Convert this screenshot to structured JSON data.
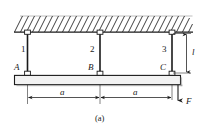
{
  "figure": {
    "caption": "(a)",
    "colors": {
      "line": "#1a1a1a",
      "hatch": "#2b2b2b",
      "beam_fill": "#f2f2f2",
      "beam_shadow": "#8c8c8c",
      "background": "#ffffff"
    },
    "rod_labels": [
      {
        "name": "rod-label-1",
        "text": "1"
      },
      {
        "name": "rod-label-2",
        "text": "2"
      },
      {
        "name": "rod-label-3",
        "text": "3"
      }
    ],
    "joint_labels": [
      {
        "name": "joint-label-a",
        "text": "A"
      },
      {
        "name": "joint-label-b",
        "text": "B"
      },
      {
        "name": "joint-label-c",
        "text": "C"
      }
    ],
    "dimensions": [
      {
        "name": "dimension-span-left",
        "text": "a"
      },
      {
        "name": "dimension-span-right",
        "text": "a"
      },
      {
        "name": "dimension-rod-length",
        "text": "l"
      }
    ],
    "loads": [
      {
        "name": "load-force-f",
        "text": "F"
      }
    ]
  }
}
